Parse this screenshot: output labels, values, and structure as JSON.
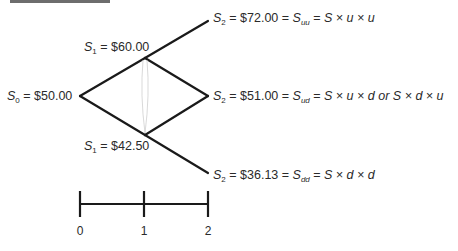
{
  "diagram": {
    "type": "binomial-tree",
    "nodes": {
      "s0": {
        "sym": "S",
        "sub": "0",
        "value": "$50.00"
      },
      "s1_up": {
        "sym": "S",
        "sub": "1",
        "value": "$60.00"
      },
      "s1_down": {
        "sym": "S",
        "sub": "1",
        "value": "$42.50"
      },
      "s2_uu": {
        "sym": "S",
        "sub": "2",
        "value": "$72.00",
        "alias_sub": "uu",
        "formula": "S × u × u"
      },
      "s2_ud": {
        "sym": "S",
        "sub": "2",
        "value": "$51.00",
        "alias_sub": "ud",
        "formula": "S × u × d or S × d × u"
      },
      "s2_dd": {
        "sym": "S",
        "sub": "2",
        "value": "$36.13",
        "alias_sub": "dd",
        "formula": "S × d × d"
      }
    },
    "timeline": {
      "ticks": [
        "0",
        "1",
        "2"
      ]
    },
    "colors": {
      "line": "#1a1a1a",
      "text": "#2a2a2a"
    }
  }
}
